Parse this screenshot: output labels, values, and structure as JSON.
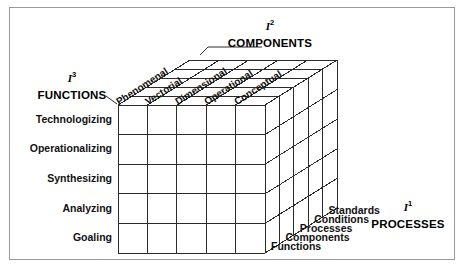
{
  "figure": {
    "type": "3d-cube-matrix"
  },
  "axes": {
    "depth": {
      "symbol": "I",
      "exponent": "1",
      "title": "PROCESSES"
    },
    "columns": {
      "symbol": "I",
      "exponent": "2",
      "title": "COMPONENTS"
    },
    "rows": {
      "symbol": "I",
      "exponent": "3",
      "title": "FUNCTIONS"
    }
  },
  "column_labels": [
    "Phenomenal",
    "Vectorial",
    "Dimensional",
    "Operational",
    "Conceptual"
  ],
  "row_labels": [
    "Technologizing",
    "Operationalizing",
    "Synthesizing",
    "Analyzing",
    "Goaling"
  ],
  "depth_labels": [
    "Standards",
    "Conditions",
    "Processes",
    "Components",
    "Functions"
  ],
  "colors": {
    "line": "#2b2b2b",
    "frame": "#9a9a9a",
    "text": "#000000",
    "background": "#ffffff"
  },
  "geometry": {
    "front_face": {
      "x": 118,
      "y": 105,
      "width": 147,
      "height": 148
    },
    "depth_offset": {
      "dx": 72,
      "dy": -45
    },
    "divisions": 5
  }
}
